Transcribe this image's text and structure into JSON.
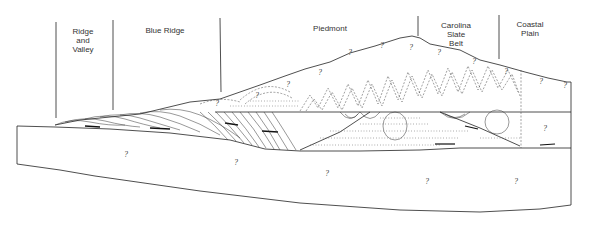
{
  "diagram": {
    "type": "geologic-cross-section",
    "provinces": [
      {
        "label_lines": [
          "Ridge",
          "and",
          "Valley"
        ],
        "x": 83
      },
      {
        "label_lines": [
          "Blue Ridge"
        ],
        "x": 165
      },
      {
        "label_lines": [
          "Piedmont"
        ],
        "x": 330
      },
      {
        "label_lines": [
          "Carolina",
          "Slate",
          "Belt"
        ],
        "x": 456
      },
      {
        "label_lines": [
          "Coastal",
          "Plain"
        ],
        "x": 530
      }
    ],
    "boundary_lines_x": [
      56,
      113,
      220,
      418,
      499
    ],
    "unknown_marker": "?",
    "question_marks": [
      {
        "x": 126,
        "y": 157
      },
      {
        "x": 236,
        "y": 165
      },
      {
        "x": 327,
        "y": 176
      },
      {
        "x": 427,
        "y": 184
      },
      {
        "x": 516,
        "y": 184
      },
      {
        "x": 545,
        "y": 129
      },
      {
        "x": 320,
        "y": 73
      },
      {
        "x": 350,
        "y": 53
      },
      {
        "x": 411,
        "y": 48
      },
      {
        "x": 439,
        "y": 53
      },
      {
        "x": 474,
        "y": 62
      },
      {
        "x": 506,
        "y": 72
      },
      {
        "x": 541,
        "y": 82
      },
      {
        "x": 565,
        "y": 86
      },
      {
        "x": 382,
        "y": 46
      },
      {
        "x": 257,
        "y": 96
      },
      {
        "x": 288,
        "y": 85
      },
      {
        "x": 217,
        "y": 104
      }
    ]
  }
}
